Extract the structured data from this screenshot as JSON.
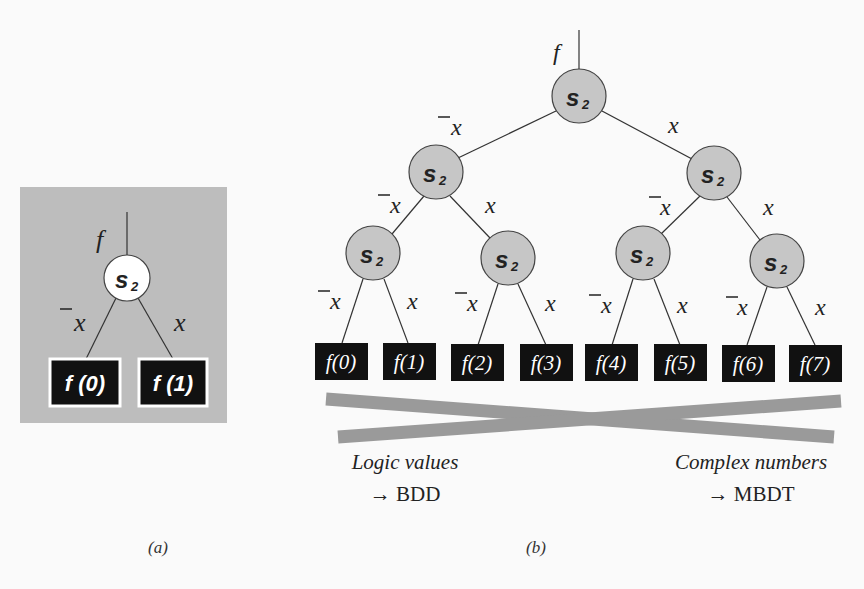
{
  "panel_a": {
    "caption": "(a)",
    "input_label": "f",
    "node_label": "s",
    "node_subscript": "2",
    "edge_left_label": "x",
    "edge_right_label": "x",
    "leaves": [
      "f (0)",
      "f (1)"
    ],
    "background_color": "#bdbdbd",
    "node_fill": "#ffffff"
  },
  "panel_b": {
    "caption": "(b)",
    "input_label": "f",
    "node_label": "s",
    "node_subscript": "2",
    "edge_left_label": "x",
    "edge_right_label": "x",
    "leaves": [
      "f(0)",
      "f(1)",
      "f(2)",
      "f(3)",
      "f(4)",
      "f(5)",
      "f(6)",
      "f(7)"
    ],
    "node_fill": "#c6c6c6",
    "cross_color": "#9a9a9a",
    "left_annotation": {
      "line1": "Logic values",
      "line2": "→ BDD"
    },
    "right_annotation": {
      "line1": "Complex numbers",
      "line2": "→ MBDT"
    }
  }
}
